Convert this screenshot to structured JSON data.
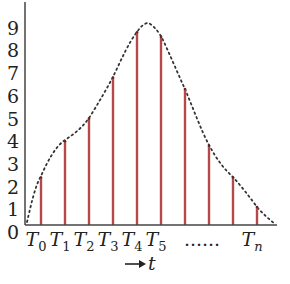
{
  "chart_data": {
    "type": "bar",
    "subtype": "stem-samples-with-envelope",
    "title": "",
    "xlabel": "t",
    "xlabel_prefix_arrow": "→",
    "ylabel": "",
    "ylim": [
      0,
      9
    ],
    "yticks": [
      "0",
      "1",
      "2",
      "3",
      "4",
      "5",
      "6",
      "7",
      "8",
      "9"
    ],
    "categories": [
      "T0",
      "T1",
      "T2",
      "T3",
      "T4",
      "T5",
      "",
      "",
      "",
      "Tn"
    ],
    "x_tick_labels": [
      {
        "base": "T",
        "sub": "0"
      },
      {
        "base": "T",
        "sub": "1"
      },
      {
        "base": "T",
        "sub": "2"
      },
      {
        "base": "T",
        "sub": "3"
      },
      {
        "base": "T",
        "sub": "4"
      },
      {
        "base": "T",
        "sub": "5"
      },
      {
        "base": "T",
        "sub": "n"
      }
    ],
    "ellipsis_label": "......",
    "values": [
      2.4,
      4.0,
      5.0,
      6.8,
      8.8,
      8.6,
      6.3,
      3.8,
      2.4,
      1.1
    ],
    "envelope": {
      "style": "dotted",
      "description": "smooth continuous signal sampled by the stems",
      "peak_value": 9.2,
      "start_value": 0.1,
      "end_value": 0.2
    },
    "colors": {
      "stems": "#b5484a",
      "envelope": "#333333",
      "axes": "#444444"
    },
    "grid": false,
    "legend": null
  }
}
